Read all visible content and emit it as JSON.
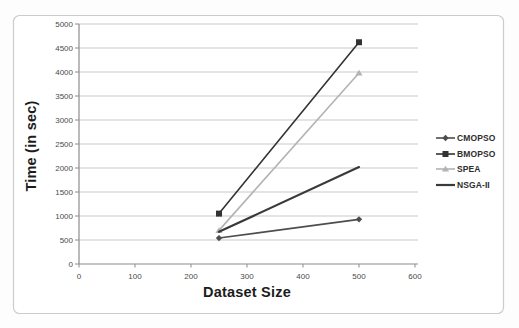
{
  "chart_data": {
    "type": "line",
    "title": "",
    "xlabel": "Dataset Size",
    "ylabel": "Time (in sec)",
    "x": [
      250,
      500
    ],
    "series": [
      {
        "name": "CMOPSO",
        "values": [
          540,
          930
        ],
        "color": "#4d4d4d",
        "marker": "diamond",
        "width": 1.6
      },
      {
        "name": "BMOPSO",
        "values": [
          1050,
          4620
        ],
        "color": "#333333",
        "marker": "square",
        "width": 1.6
      },
      {
        "name": "SPEA",
        "values": [
          700,
          3980
        ],
        "color": "#b3b3b3",
        "marker": "triangle",
        "width": 1.6
      },
      {
        "name": "NSGA-II",
        "values": [
          670,
          2020
        ],
        "color": "#3a3a3a",
        "marker": "none",
        "width": 2.2
      }
    ],
    "xlim": [
      0,
      600
    ],
    "ylim": [
      0,
      5000
    ],
    "xticks": [
      0,
      100,
      200,
      300,
      400,
      500,
      600
    ],
    "yticks": [
      0,
      500,
      1000,
      1500,
      2000,
      2500,
      3000,
      3500,
      4000,
      4500,
      5000
    ],
    "grid": "horizontal",
    "legend_position": "right",
    "colors": {
      "grid": "#c9c9c9",
      "axis": "#8c8c8c",
      "tick_text": "#4a4a4a",
      "frame": "#cccccc",
      "background": "#ffffff"
    }
  }
}
